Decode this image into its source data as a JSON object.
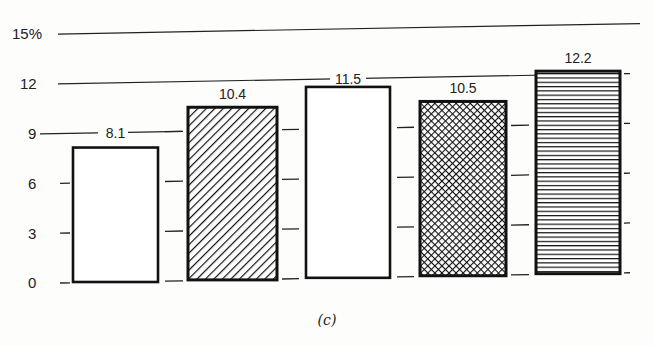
{
  "chart_data": {
    "type": "bar",
    "title": "",
    "caption": "(c)",
    "xlabel": "",
    "ylabel": "",
    "y_unit": "%",
    "ylim": [
      0,
      15
    ],
    "yticks": [
      0,
      3,
      6,
      9,
      12,
      15
    ],
    "ytick_labels": [
      "0",
      "3",
      "6",
      "9",
      "12",
      "15%"
    ],
    "categories": [
      "1",
      "2",
      "3",
      "4",
      "5"
    ],
    "values": [
      8.1,
      10.4,
      11.5,
      10.5,
      12.2
    ],
    "value_labels": [
      "8.1",
      "10.4",
      "11.5",
      "10.5",
      "12.2"
    ],
    "bar_patterns": [
      "blank",
      "diagonal-hatch",
      "blank",
      "crosshatch",
      "horizontal-lines"
    ],
    "grid": "horizontal rules at 15, 12, 9 across top; short dash ticks between bars",
    "legend": "none"
  }
}
